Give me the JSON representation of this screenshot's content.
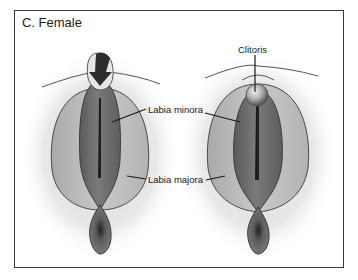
{
  "figure": {
    "title": "C. Female",
    "labels": {
      "clitoris": "Clitoris",
      "labia_minora": "Labia minora",
      "labia_majora": "Labia majora"
    },
    "colors": {
      "frame": "#3a3a3a",
      "outer_tissue": "#bdbdbd",
      "inner_tissue": "#6f6f6f",
      "dark_cleft": "#1e1e1e",
      "outline": "#4a4a4a"
    }
  }
}
